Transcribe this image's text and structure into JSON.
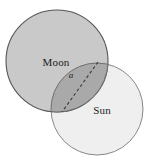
{
  "figure": {
    "type": "geometry-diagram",
    "background_color": "#ffffff",
    "bodies": [
      {
        "id": "moon",
        "label": "Moon",
        "center_x": 57,
        "center_y": 61,
        "radius": 51,
        "fill_color": "#c9c9c9",
        "stroke_color": "#555555",
        "label_x": 56,
        "label_y": 66
      },
      {
        "id": "sun",
        "label": "Sun",
        "center_x": 97,
        "center_y": 109,
        "radius": 46,
        "fill_color": "#efefef",
        "stroke_color": "#7a7a7a",
        "label_x": 102,
        "label_y": 114
      }
    ],
    "overlap": {
      "id": "lens",
      "fill_color": "#a9a9a9",
      "stroke_color": "#6f6f6f"
    },
    "chord": {
      "id": "chord-a",
      "label": "a",
      "label_x": 71,
      "label_y": 78,
      "x1": 98,
      "y1": 62,
      "x2": 62,
      "y2": 112,
      "stroke_color": "#3b3b3b",
      "dash_pattern": "3 2.5"
    }
  }
}
